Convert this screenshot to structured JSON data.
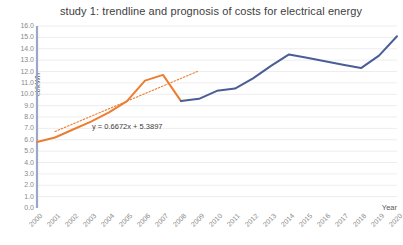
{
  "chart_data": {
    "type": "line",
    "title": "study 1: trendline and prognosis of costs for electrical energy",
    "xlabel": "Year",
    "ylabel": "ct/kWh",
    "ylim": [
      0.0,
      16.0
    ],
    "ytick_step": 1.0,
    "grid": true,
    "legend": "none",
    "yticks": [
      "16.0",
      "15.0",
      "14.0",
      "13.0",
      "12.0",
      "11.0",
      "10.0",
      "9.0",
      "8.0",
      "7.0",
      "6.0",
      "5.0",
      "4.0",
      "3.0",
      "2.0",
      "1.0",
      "0.0"
    ],
    "categories": [
      "2000",
      "2001",
      "2002",
      "2003",
      "2004",
      "2005",
      "2006",
      "2007",
      "2008",
      "2009",
      "2010",
      "2011",
      "2012",
      "2013",
      "2014",
      "2015",
      "2016",
      "2017",
      "2018",
      "2019",
      "2020"
    ],
    "series": [
      {
        "name": "historic costs",
        "color": "#ED7D31",
        "values": [
          5.8,
          6.2,
          6.9,
          7.6,
          8.4,
          9.4,
          11.2,
          11.7,
          9.4,
          null,
          null,
          null,
          null,
          null,
          null,
          null,
          null,
          null,
          null,
          null,
          null
        ]
      },
      {
        "name": "prognosis costs",
        "color": "#4A5E96",
        "values": [
          null,
          null,
          null,
          null,
          null,
          null,
          null,
          null,
          9.4,
          9.6,
          10.3,
          10.5,
          11.4,
          12.5,
          13.5,
          13.2,
          12.9,
          12.6,
          12.3,
          13.4,
          15.1
        ]
      }
    ],
    "trendline": {
      "equation": "y = 0.6672x + 5.3897",
      "slope": 0.6672,
      "intercept": 5.3897,
      "color": "#ED7D31",
      "style": "dotted",
      "x_start": "2001",
      "x_end": "2009"
    },
    "annotations": [
      {
        "name": "trendline-equation",
        "text": "y = 0.6672x + 5.3897"
      }
    ]
  }
}
